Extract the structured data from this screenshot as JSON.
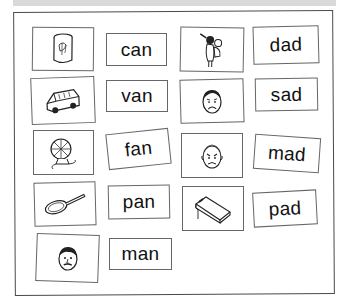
{
  "worksheet": {
    "title_band": "",
    "pairs": [
      {
        "picture": "can-icon",
        "word": "can"
      },
      {
        "picture": "van-icon",
        "word": "van"
      },
      {
        "picture": "fan-icon",
        "word": "fan"
      },
      {
        "picture": "pan-icon",
        "word": "pan"
      },
      {
        "picture": "man-icon",
        "word": "man"
      },
      {
        "picture": "dad-icon",
        "word": "dad"
      },
      {
        "picture": "sad-face-icon",
        "word": "sad"
      },
      {
        "picture": "mad-face-icon",
        "word": "mad"
      },
      {
        "picture": "notepad-icon",
        "word": "pad"
      }
    ]
  }
}
